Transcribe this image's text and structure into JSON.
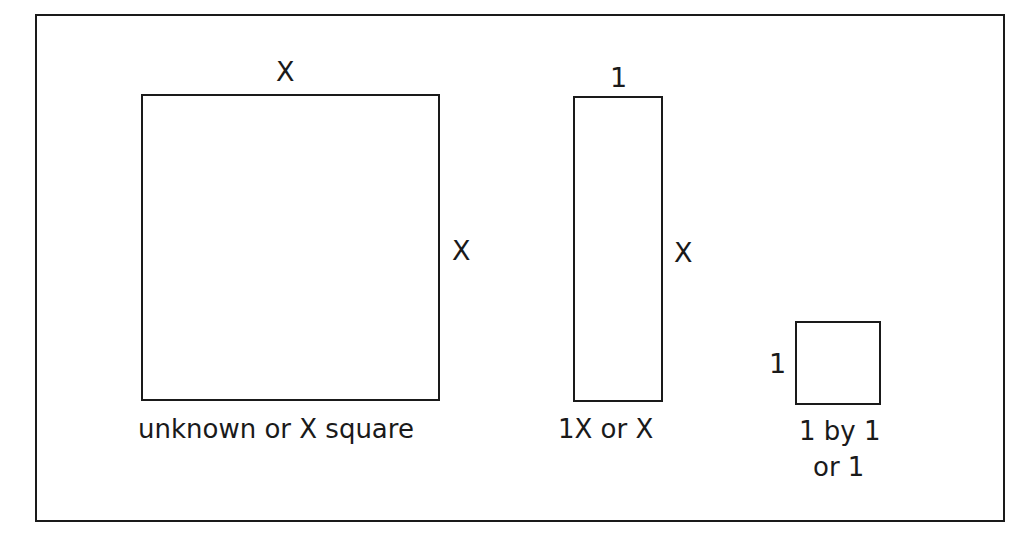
{
  "diagram": {
    "title": "",
    "tiles": [
      {
        "id": "x-square",
        "top_label": "X",
        "side_label": "X",
        "caption": "unknown or X square"
      },
      {
        "id": "x-rod",
        "top_label": "1",
        "side_label": "X",
        "caption": "1X or X"
      },
      {
        "id": "unit-square",
        "side_label": "1",
        "caption_line1": "1 by 1",
        "caption_line2": "or 1"
      }
    ]
  }
}
